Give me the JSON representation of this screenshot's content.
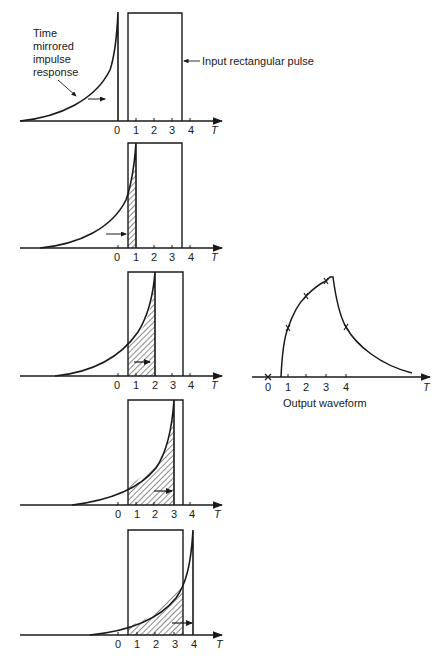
{
  "annotations": {
    "impulse_label_lines": [
      "Time",
      "mirrored",
      "impulse",
      "response"
    ],
    "pulse_label": "Input rectangular pulse",
    "output_label": "Output waveform",
    "axis_var": "T"
  },
  "tick_labels": [
    "0",
    "1",
    "2",
    "3",
    "4"
  ],
  "panels": [
    {
      "shift": 0,
      "axis_y": 121,
      "top_y": 13
    },
    {
      "shift": 1,
      "axis_y": 248,
      "top_y": 143
    },
    {
      "shift": 2,
      "axis_y": 376,
      "top_y": 272
    },
    {
      "shift": 3,
      "axis_y": 505,
      "top_y": 400
    },
    {
      "shift": 4,
      "axis_y": 635,
      "top_y": 530
    }
  ],
  "output_waveform": {
    "markers": [
      {
        "t": 0,
        "label": "0"
      },
      {
        "t": 1,
        "label": "1"
      },
      {
        "t": 2,
        "label": "2"
      },
      {
        "t": 3,
        "label": "3"
      },
      {
        "t": 4,
        "label": "4"
      }
    ]
  },
  "colors": {
    "ink": "#1a1a1a",
    "background": "#ffffff"
  }
}
